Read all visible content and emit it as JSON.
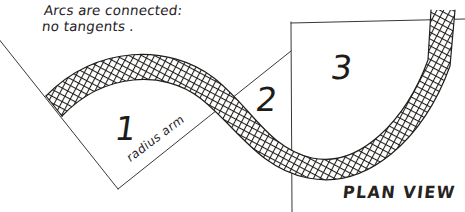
{
  "drawing": {
    "title": "PLAN VIEW",
    "type": "hand-drawn engineering plan sketch",
    "note_line_1": "Arcs are connected:",
    "note_line_2": "no tangents .",
    "plan_view_label": "PLAN VIEW",
    "radius_arm_label": "radius arm",
    "region_labels": [
      "1",
      "2",
      "3"
    ],
    "colors": {
      "ink": "#26231f",
      "line": "#3a3733",
      "hatch": "#201e1b",
      "paper": "#ffffff"
    }
  },
  "regions": [
    {
      "id": "region-1",
      "label": "1"
    },
    {
      "id": "region-2",
      "label": "2"
    },
    {
      "id": "region-3",
      "label": "3"
    }
  ],
  "annotations": {
    "note": "Arcs are connected: no tangents .",
    "radius_arm": "radius arm",
    "view": "PLAN VIEW"
  }
}
